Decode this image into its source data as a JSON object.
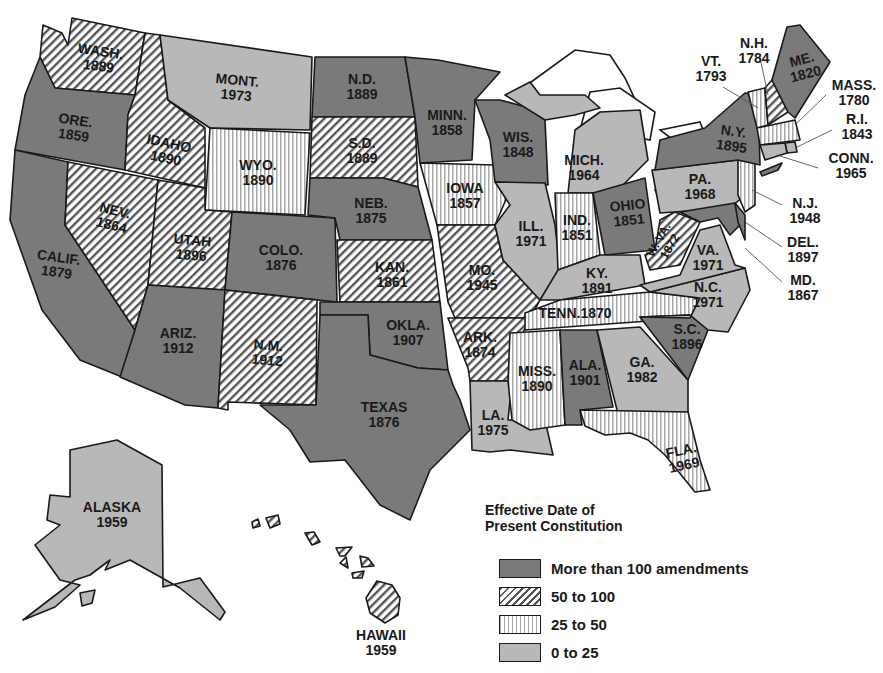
{
  "title": "Effective Date of Present Constitution",
  "legend": {
    "title_line1": "Effective Date of",
    "title_line2": "Present Constitution",
    "items": [
      {
        "key": "dark",
        "label": "More than 100 amendments",
        "color": "#7a7a7a",
        "pattern": "solid-dark"
      },
      {
        "key": "diag",
        "label": "50 to 100",
        "color": "#555555",
        "pattern": "diagonal-hatch"
      },
      {
        "key": "vert",
        "label": "25 to 50",
        "color": "#aaaaaa",
        "pattern": "vertical-stripes"
      },
      {
        "key": "light",
        "label": "0 to 25",
        "color": "#b8b8b8",
        "pattern": "solid-light"
      }
    ]
  },
  "states": {
    "wash": {
      "name": "WASH.",
      "year": "1889",
      "category": "50 to 100"
    },
    "ore": {
      "name": "ORE.",
      "year": "1859",
      "category": "More than 100 amendments"
    },
    "calif": {
      "name": "CALIF.",
      "year": "1879",
      "category": "More than 100 amendments"
    },
    "idaho": {
      "name": "IDAHO",
      "year": "1890",
      "category": "50 to 100"
    },
    "nev": {
      "name": "NEV.",
      "year": "1864",
      "category": "50 to 100"
    },
    "mont": {
      "name": "MONT.",
      "year": "1973",
      "category": "0 to 25"
    },
    "wyo": {
      "name": "WYO.",
      "year": "1890",
      "category": "25 to 50"
    },
    "utah": {
      "name": "UTAH",
      "year": "1896",
      "category": "50 to 100"
    },
    "colo": {
      "name": "COLO.",
      "year": "1876",
      "category": "More than 100 amendments"
    },
    "ariz": {
      "name": "ARIZ.",
      "year": "1912",
      "category": "More than 100 amendments"
    },
    "nm": {
      "name": "N.M.",
      "year": "1912",
      "category": "50 to 100"
    },
    "nd": {
      "name": "N.D.",
      "year": "1889",
      "category": "More than 100 amendments"
    },
    "sd": {
      "name": "S.D.",
      "year": "1889",
      "category": "50 to 100"
    },
    "neb": {
      "name": "NEB.",
      "year": "1875",
      "category": "More than 100 amendments"
    },
    "kan": {
      "name": "KAN.",
      "year": "1861",
      "category": "50 to 100"
    },
    "okla": {
      "name": "OKLA.",
      "year": "1907",
      "category": "More than 100 amendments"
    },
    "texas": {
      "name": "TEXAS",
      "year": "1876",
      "category": "More than 100 amendments"
    },
    "minn": {
      "name": "MINN.",
      "year": "1858",
      "category": "More than 100 amendments"
    },
    "iowa": {
      "name": "IOWA",
      "year": "1857",
      "category": "25 to 50"
    },
    "mo": {
      "name": "MO.",
      "year": "1945",
      "category": "50 to 100"
    },
    "ark": {
      "name": "ARK.",
      "year": "1874",
      "category": "50 to 100"
    },
    "la": {
      "name": "LA.",
      "year": "1975",
      "category": "0 to 25"
    },
    "wis": {
      "name": "WIS.",
      "year": "1848",
      "category": "More than 100 amendments"
    },
    "ill": {
      "name": "ILL.",
      "year": "1971",
      "category": "0 to 25"
    },
    "mich": {
      "name": "MICH.",
      "year": "1964",
      "category": "0 to 25"
    },
    "ind": {
      "name": "IND.",
      "year": "1851",
      "category": "25 to 50"
    },
    "ohio": {
      "name": "OHIO",
      "year": "1851",
      "category": "More than 100 amendments"
    },
    "ky": {
      "name": "KY.",
      "year": "1891",
      "category": "0 to 25"
    },
    "tenn": {
      "name": "TENN.",
      "year": "1870",
      "category": "25 to 50"
    },
    "miss": {
      "name": "MISS.",
      "year": "1890",
      "category": "25 to 50"
    },
    "ala": {
      "name": "ALA.",
      "year": "1901",
      "category": "More than 100 amendments"
    },
    "ga": {
      "name": "GA.",
      "year": "1982",
      "category": "0 to 25"
    },
    "fla": {
      "name": "FLA.",
      "year": "1969",
      "category": "25 to 50"
    },
    "sc": {
      "name": "S.C.",
      "year": "1896",
      "category": "More than 100 amendments"
    },
    "nc": {
      "name": "N.C.",
      "year": "1971",
      "category": "0 to 25"
    },
    "va": {
      "name": "VA.",
      "year": "1971",
      "category": "0 to 25"
    },
    "wva": {
      "name": "W. VA.",
      "year": "1872",
      "category": "50 to 100"
    },
    "pa": {
      "name": "PA.",
      "year": "1968",
      "category": "0 to 25"
    },
    "ny": {
      "name": "N.Y.",
      "year": "1895",
      "category": "More than 100 amendments"
    },
    "vt": {
      "name": "VT.",
      "year": "1793",
      "category": "25 to 50"
    },
    "nh": {
      "name": "N.H.",
      "year": "1784",
      "category": "50 to 100"
    },
    "me": {
      "name": "ME.",
      "year": "1820",
      "category": "More than 100 amendments"
    },
    "mass": {
      "name": "MASS.",
      "year": "1780",
      "category": "25 to 50"
    },
    "ri": {
      "name": "R.I.",
      "year": "1843",
      "category": "0 to 25"
    },
    "conn": {
      "name": "CONN.",
      "year": "1965",
      "category": "0 to 25"
    },
    "nj": {
      "name": "N.J.",
      "year": "1948",
      "category": "25 to 50"
    },
    "del": {
      "name": "DEL.",
      "year": "1897",
      "category": "More than 100 amendments"
    },
    "md": {
      "name": "MD.",
      "year": "1867",
      "category": "More than 100 amendments"
    },
    "alaska": {
      "name": "ALASKA",
      "year": "1959",
      "category": "0 to 25"
    },
    "hawaii": {
      "name": "HAWAII",
      "year": "1959",
      "category": "50 to 100"
    }
  }
}
